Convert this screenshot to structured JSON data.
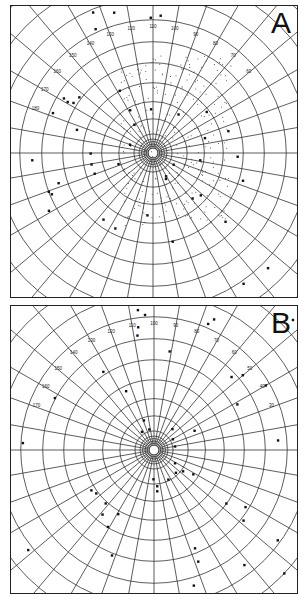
{
  "figure": {
    "panels": [
      {
        "letter": "A",
        "projection": "polar stereographic grid",
        "pole_label": "north pole",
        "meridian_labels": [
          "180",
          "170",
          "160",
          "150",
          "140",
          "130",
          "120",
          "110",
          "100",
          "90",
          "80",
          "70",
          "60"
        ],
        "features": [
          "coastlines",
          "stippled region (continent interior)",
          "station markers along meridians"
        ]
      },
      {
        "letter": "B",
        "projection": "polar stereographic grid",
        "pole_label": "south pole",
        "meridian_labels": [
          "170",
          "160",
          "150",
          "140",
          "130",
          "120",
          "110",
          "100",
          "90",
          "80",
          "70",
          "60",
          "50",
          "40",
          "30"
        ],
        "features": [
          "coastlines",
          "station markers along meridians"
        ]
      }
    ],
    "caption_fragment": "..."
  }
}
